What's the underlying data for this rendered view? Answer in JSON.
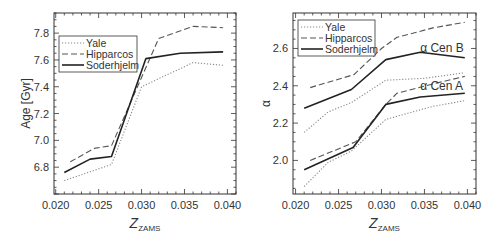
{
  "figure": {
    "width": 497,
    "height": 237,
    "colors": {
      "frame": "#333333",
      "yale": "#888888",
      "hipparcos": "#555555",
      "soderhjelm": "#222222",
      "text": "#333333"
    }
  },
  "chart_data": [
    {
      "type": "line",
      "title": "",
      "xlabel": "Z",
      "xlabel_sub": "ZAMS",
      "ylabel": "Age [Gyr]",
      "xlim": [
        0.0198,
        0.041
      ],
      "ylim": [
        6.6,
        7.95
      ],
      "xticks": [
        0.02,
        0.025,
        0.03,
        0.035,
        0.04
      ],
      "xtick_labels": [
        "0.020",
        "0.025",
        "0.030",
        "0.035",
        "0.040"
      ],
      "yticks": [
        6.8,
        7.0,
        7.2,
        7.4,
        7.6,
        7.8
      ],
      "ytick_labels": [
        "6.8",
        "7.0",
        "7.2",
        "7.4",
        "7.6",
        "7.8"
      ],
      "grid": false,
      "legend_position": "upper left",
      "frame_px": {
        "left": 54,
        "top": 13,
        "right": 236,
        "bottom": 194
      },
      "legend_px": {
        "x": 59,
        "y": 36,
        "w": 78,
        "h": 36
      },
      "series": [
        {
          "name": "Yale",
          "style": "dotted",
          "points": [
            [
              0.021,
              6.7
            ],
            [
              0.0265,
              6.82
            ],
            [
              0.03,
              7.4
            ],
            [
              0.036,
              7.58
            ],
            [
              0.0395,
              7.56
            ]
          ]
        },
        {
          "name": "Hipparcos",
          "style": "dashed",
          "points": [
            [
              0.0217,
              6.84
            ],
            [
              0.0245,
              6.94
            ],
            [
              0.0265,
              6.96
            ],
            [
              0.032,
              7.76
            ],
            [
              0.036,
              7.85
            ],
            [
              0.0395,
              7.84
            ]
          ]
        },
        {
          "name": "Soderhjelm",
          "style": "solid",
          "points": [
            [
              0.021,
              6.76
            ],
            [
              0.024,
              6.86
            ],
            [
              0.0265,
              6.88
            ],
            [
              0.0305,
              7.61
            ],
            [
              0.0345,
              7.65
            ],
            [
              0.0395,
              7.66
            ]
          ]
        }
      ],
      "annotations": []
    },
    {
      "type": "line",
      "title": "",
      "xlabel": "Z",
      "xlabel_sub": "ZAMS",
      "ylabel": "α",
      "xlim": [
        0.0197,
        0.041
      ],
      "ylim": [
        1.82,
        2.79
      ],
      "xticks": [
        0.02,
        0.025,
        0.03,
        0.035,
        0.04
      ],
      "xtick_labels": [
        "0.020",
        "0.025",
        "0.030",
        "0.035",
        "0.040"
      ],
      "yticks": [
        2.0,
        2.2,
        2.4,
        2.6
      ],
      "ytick_labels": [
        "2.0",
        "2.2",
        "2.4",
        "2.6"
      ],
      "grid": false,
      "legend_position": "upper left",
      "frame_px": {
        "left": 293,
        "top": 13,
        "right": 476,
        "bottom": 194
      },
      "legend_px": {
        "x": 298,
        "y": 20,
        "w": 77,
        "h": 36
      },
      "series": [
        {
          "name": "Yale",
          "group": "α Cen B",
          "style": "dotted",
          "points": [
            [
              0.021,
              2.15
            ],
            [
              0.0238,
              2.26
            ],
            [
              0.0265,
              2.31
            ],
            [
              0.0305,
              2.43
            ],
            [
              0.035,
              2.44
            ],
            [
              0.0397,
              2.47
            ]
          ]
        },
        {
          "name": "Hipparcos",
          "group": "α Cen B",
          "style": "dashed",
          "points": [
            [
              0.0217,
              2.39
            ],
            [
              0.0268,
              2.46
            ],
            [
              0.03,
              2.6
            ],
            [
              0.0318,
              2.66
            ],
            [
              0.036,
              2.71
            ],
            [
              0.0397,
              2.74
            ]
          ]
        },
        {
          "name": "Soderhjelm",
          "group": "α Cen B",
          "style": "solid",
          "points": [
            [
              0.021,
              2.28
            ],
            [
              0.0265,
              2.38
            ],
            [
              0.0305,
              2.54
            ],
            [
              0.0345,
              2.58
            ],
            [
              0.0397,
              2.55
            ]
          ]
        },
        {
          "name": "Yale",
          "group": "α Cen A",
          "style": "dotted",
          "points": [
            [
              0.021,
              1.86
            ],
            [
              0.0238,
              1.99
            ],
            [
              0.0265,
              2.05
            ],
            [
              0.0305,
              2.22
            ],
            [
              0.036,
              2.29
            ],
            [
              0.0397,
              2.32
            ]
          ]
        },
        {
          "name": "Hipparcos",
          "group": "α Cen A",
          "style": "dashed",
          "points": [
            [
              0.0217,
              2.0
            ],
            [
              0.027,
              2.1
            ],
            [
              0.0305,
              2.3
            ],
            [
              0.0318,
              2.36
            ],
            [
              0.036,
              2.41
            ],
            [
              0.0397,
              2.45
            ]
          ]
        },
        {
          "name": "Soderhjelm",
          "group": "α Cen A",
          "style": "solid",
          "points": [
            [
              0.021,
              1.95
            ],
            [
              0.0267,
              2.07
            ],
            [
              0.0305,
              2.3
            ],
            [
              0.0345,
              2.34
            ],
            [
              0.0397,
              2.36
            ]
          ]
        }
      ],
      "annotations": [
        {
          "text": "α Cen B",
          "x": 0.0345,
          "y": 2.6
        },
        {
          "text": "α Cen A",
          "x": 0.0345,
          "y": 2.4
        }
      ]
    }
  ]
}
